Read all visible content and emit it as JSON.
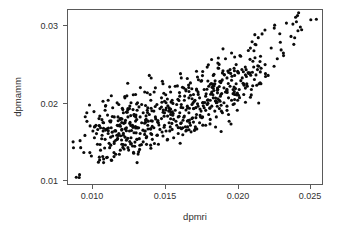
{
  "plot": {
    "title": "",
    "background_color": "#ffffff",
    "point_color": "#0a0a0a",
    "axis_color": "#5a5a5a",
    "text_color": "#303030"
  },
  "axes": {
    "x_title": "dpmri",
    "y_title": "dpmamm",
    "x_ticks": [
      "0.010",
      "0.015",
      "0.020",
      "0.025"
    ],
    "y_ticks": [
      "0.01",
      "0.02",
      "0.03"
    ]
  },
  "chart_data": {
    "type": "scatter",
    "title": "",
    "xlabel": "dpmri",
    "ylabel": "dpmamm",
    "xlim": [
      0.0088,
      0.0256
    ],
    "ylim": [
      0.0103,
      0.0315
    ],
    "xticks": [
      0.01,
      0.015,
      0.02,
      0.025
    ],
    "yticks": [
      0.01,
      0.02,
      0.03
    ],
    "grid": false,
    "legend": false,
    "marker": "filled-circle",
    "marker_size": 2,
    "n_points": 620,
    "correlation": 0.85,
    "series": [
      {
        "name": "dpmamm vs dpmri",
        "x": [
          0.0092,
          0.0096,
          0.0097,
          0.0101,
          0.0103,
          0.0104,
          0.0105,
          0.0106,
          0.0107,
          0.0108,
          0.0109,
          0.011,
          0.011,
          0.0111,
          0.0112,
          0.0112,
          0.0113,
          0.0113,
          0.0114,
          0.0114,
          0.0115,
          0.0115,
          0.0116,
          0.0116,
          0.0117,
          0.0117,
          0.0118,
          0.0118,
          0.0119,
          0.0119,
          0.012,
          0.012,
          0.0121,
          0.0121,
          0.0122,
          0.0122,
          0.0123,
          0.0123,
          0.0124,
          0.0124,
          0.0125,
          0.0125,
          0.0126,
          0.0126,
          0.0127,
          0.0127,
          0.0128,
          0.0128,
          0.0129,
          0.0129,
          0.013,
          0.013,
          0.0131,
          0.0131,
          0.0132,
          0.0132,
          0.0133,
          0.0133,
          0.0134,
          0.0134,
          0.0135,
          0.0135,
          0.0136,
          0.0136,
          0.0137,
          0.0137,
          0.0138,
          0.0138,
          0.0139,
          0.0139,
          0.014,
          0.014,
          0.0141,
          0.0141,
          0.0142,
          0.0142,
          0.0143,
          0.0143,
          0.0144,
          0.0144,
          0.0145,
          0.0145,
          0.0146,
          0.0146,
          0.0147,
          0.0147,
          0.0148,
          0.0148,
          0.0149,
          0.0149,
          0.015,
          0.015,
          0.0151,
          0.0151,
          0.0152,
          0.0152,
          0.0153,
          0.0153,
          0.0154,
          0.0154,
          0.0155,
          0.0155,
          0.0156,
          0.0156,
          0.0157,
          0.0157,
          0.0158,
          0.0158,
          0.0159,
          0.0159,
          0.016,
          0.016,
          0.0161,
          0.0161,
          0.0162,
          0.0162,
          0.0163,
          0.0163,
          0.0164,
          0.0164,
          0.0165,
          0.0165,
          0.0166,
          0.0166,
          0.0167,
          0.0167,
          0.0168,
          0.0168,
          0.0169,
          0.0169,
          0.017,
          0.017,
          0.0171,
          0.0171,
          0.0172,
          0.0172,
          0.0173,
          0.0173,
          0.0174,
          0.0174,
          0.0175,
          0.0175,
          0.0176,
          0.0176,
          0.0177,
          0.0177,
          0.0178,
          0.0178,
          0.0179,
          0.0179,
          0.018,
          0.018,
          0.0181,
          0.0181,
          0.0182,
          0.0182,
          0.0183,
          0.0183,
          0.0184,
          0.0184,
          0.0185,
          0.0185,
          0.0186,
          0.0186,
          0.0187,
          0.0187,
          0.0188,
          0.0188,
          0.0189,
          0.0189,
          0.019,
          0.019,
          0.0191,
          0.0191,
          0.0192,
          0.0192,
          0.0193,
          0.0193,
          0.0194,
          0.0194,
          0.0195,
          0.0195,
          0.0196,
          0.0196,
          0.0197,
          0.0197,
          0.0198,
          0.0198,
          0.0199,
          0.0199,
          0.02,
          0.02,
          0.0201,
          0.0202,
          0.0203,
          0.0204,
          0.0205,
          0.0206,
          0.0207,
          0.0208,
          0.0209,
          0.021,
          0.0211,
          0.0212,
          0.0213,
          0.0214,
          0.0215,
          0.0216,
          0.0218,
          0.022,
          0.0222,
          0.0224,
          0.0226,
          0.0228,
          0.023,
          0.0232,
          0.0235,
          0.0238,
          0.0242,
          0.0248
        ],
        "y": [
          0.0155,
          0.0112,
          0.0148,
          0.019,
          0.0142,
          0.0138,
          0.0168,
          0.016,
          0.0175,
          0.0152,
          0.0183,
          0.0145,
          0.0172,
          0.0163,
          0.013,
          0.0178,
          0.0158,
          0.0193,
          0.0136,
          0.017,
          0.0165,
          0.0205,
          0.0148,
          0.018,
          0.0133,
          0.0172,
          0.0162,
          0.0196,
          0.0155,
          0.0185,
          0.0168,
          0.014,
          0.0175,
          0.0158,
          0.02,
          0.0165,
          0.0145,
          0.0182,
          0.017,
          0.0152,
          0.019,
          0.0163,
          0.0178,
          0.0208,
          0.0157,
          0.0172,
          0.0185,
          0.0148,
          0.0195,
          0.0168,
          0.016,
          0.0202,
          0.0175,
          0.015,
          0.0188,
          0.0166,
          0.018,
          0.0212,
          0.0158,
          0.0193,
          0.0172,
          0.0143,
          0.0185,
          0.0165,
          0.02,
          0.0178,
          0.0155,
          0.019,
          0.0168,
          0.0215,
          0.0182,
          0.016,
          0.0196,
          0.0175,
          0.0235,
          0.0188,
          0.0165,
          0.0205,
          0.018,
          0.0158,
          0.0192,
          0.0172,
          0.022,
          0.0185,
          0.0163,
          0.02,
          0.0178,
          0.0152,
          0.0195,
          0.017,
          0.0208,
          0.0183,
          0.0162,
          0.0225,
          0.019,
          0.0175,
          0.0202,
          0.0168,
          0.0186,
          0.0158,
          0.0196,
          0.0178,
          0.0215,
          0.0188,
          0.017,
          0.0205,
          0.0182,
          0.016,
          0.0222,
          0.0193,
          0.0175,
          0.02,
          0.0185,
          0.0165,
          0.021,
          0.019,
          0.0178,
          0.0232,
          0.0196,
          0.0172,
          0.0205,
          0.0186,
          0.0168,
          0.0218,
          0.0198,
          0.018,
          0.0208,
          0.019,
          0.0175,
          0.0226,
          0.02,
          0.0183,
          0.0212,
          0.0195,
          0.017,
          0.0205,
          0.0188,
          0.024,
          0.0215,
          0.0198,
          0.0178,
          0.0208,
          0.0192,
          0.0228,
          0.0202,
          0.0185,
          0.0218,
          0.0196,
          0.0175,
          0.021,
          0.0245,
          0.02,
          0.0188,
          0.0222,
          0.0205,
          0.0182,
          0.0215,
          0.0198,
          0.0235,
          0.0208,
          0.0192,
          0.0225,
          0.0202,
          0.0185,
          0.0218,
          0.025,
          0.0205,
          0.0195,
          0.0228,
          0.0212,
          0.019,
          0.0238,
          0.022,
          0.0202,
          0.0255,
          0.0215,
          0.0198,
          0.0232,
          0.0208,
          0.0188,
          0.0242,
          0.0222,
          0.0205,
          0.0262,
          0.0218,
          0.02,
          0.0235,
          0.0212,
          0.0248,
          0.0225,
          0.0205,
          0.024,
          0.0218,
          0.0258,
          0.0232,
          0.0212,
          0.0245,
          0.0225,
          0.0265,
          0.0238,
          0.0218,
          0.0252,
          0.023,
          0.0272,
          0.0242,
          0.0225,
          0.0258,
          0.0285,
          0.0248,
          0.0235,
          0.0268,
          0.0292,
          0.0255,
          0.0275,
          0.0262,
          0.0298,
          0.0282,
          0.0305,
          0.029,
          0.0302
        ]
      }
    ]
  }
}
